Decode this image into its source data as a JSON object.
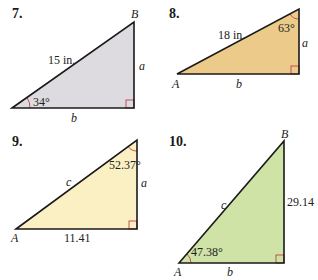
{
  "problems": [
    {
      "number": "7.",
      "fill": "#dddbe0",
      "vertex_top": "B",
      "hypotenuse": "15 in.",
      "vertical_side": "a",
      "horizontal_side": "b",
      "angle": "34°"
    },
    {
      "number": "8.",
      "fill": "#eccb8a",
      "vertex_left": "A",
      "hypotenuse": "18 in.",
      "vertical_side": "a",
      "horizontal_side": "b",
      "angle": "63°"
    },
    {
      "number": "9.",
      "fill": "#fbf0c3",
      "vertex_left": "A",
      "hypotenuse": "c",
      "vertical_side": "a",
      "horizontal_side": "11.41",
      "angle": "52.37°"
    },
    {
      "number": "10.",
      "fill": "#cfe3a6",
      "vertex_left": "A",
      "vertex_top": "B",
      "hypotenuse": "c",
      "vertical_side": "29.14",
      "horizontal_side": "b",
      "angle": "47.38°"
    }
  ],
  "colors": {
    "edge": "#1a1a1a",
    "angle_marker": "#c0404a"
  }
}
